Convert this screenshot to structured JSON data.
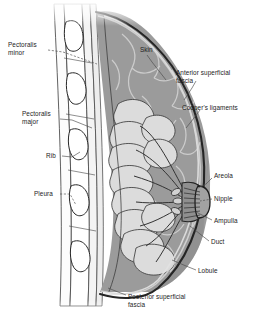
{
  "figure": {
    "type": "medical-illustration",
    "background_color": "#ffffff"
  },
  "colors": {
    "skin_line": "#2b2b2b",
    "fat_tissue": "#9b9b9b",
    "fat_tissue_dark": "#7e7e7e",
    "lobule_fill": "#d9d9d9",
    "ligament_stroke": "#c8c8c8",
    "muscle_fill": "#f2f2f2",
    "rib_fill": "#fbfbfb",
    "label_text": "#1c1c1c",
    "leader_line": "#555555"
  },
  "labels": {
    "left": [
      {
        "id": "pectoralis-minor",
        "text": "Pectoralis\nminor",
        "x": 8,
        "y": 41
      },
      {
        "id": "pectoralis-major",
        "text": "Pectoralis\nmajor",
        "x": 22,
        "y": 110
      },
      {
        "id": "rib",
        "text": "Rib",
        "x": 46,
        "y": 152
      },
      {
        "id": "pleura",
        "text": "Pleura",
        "x": 34,
        "y": 190
      }
    ],
    "right": [
      {
        "id": "skin",
        "text": "Skin",
        "x": 140,
        "y": 46
      },
      {
        "id": "anterior-superficial-fascia",
        "text": "Anterior superficial\nfascia",
        "x": 176,
        "y": 69
      },
      {
        "id": "coopers-ligaments",
        "text": "Cooper's ligaments",
        "x": 182,
        "y": 104
      },
      {
        "id": "areola",
        "text": "Areola",
        "x": 214,
        "y": 172
      },
      {
        "id": "nipple",
        "text": "Nipple",
        "x": 214,
        "y": 195
      },
      {
        "id": "ampulla",
        "text": "Ampulla",
        "x": 214,
        "y": 217
      },
      {
        "id": "duct",
        "text": "Duct",
        "x": 211,
        "y": 238
      },
      {
        "id": "lobule",
        "text": "Lobule",
        "x": 198,
        "y": 267
      }
    ],
    "bottom": [
      {
        "id": "posterior-superficial-fascia",
        "text": "Posterior superficial\nfascia",
        "x": 128,
        "y": 293
      }
    ]
  },
  "structures": [
    {
      "id": "skin",
      "name": "Skin",
      "description": "Outer boundary layer of the breast"
    },
    {
      "id": "anterior-superficial-fascia",
      "name": "Anterior superficial fascia",
      "description": "Thin fascial layer just beneath the skin"
    },
    {
      "id": "coopers-ligaments",
      "name": "Cooper's ligaments",
      "description": "Fibrous suspensory bands within fatty tissue"
    },
    {
      "id": "areola",
      "name": "Areola",
      "description": "Pigmented skin surrounding the nipple"
    },
    {
      "id": "nipple",
      "name": "Nipple",
      "description": "Projection at the centre of the areola"
    },
    {
      "id": "ampulla",
      "name": "Ampulla",
      "description": "Dilated portion of a lactiferous duct"
    },
    {
      "id": "duct",
      "name": "Duct",
      "description": "Lactiferous duct carrying milk to the nipple"
    },
    {
      "id": "lobule",
      "name": "Lobule",
      "description": "Cluster of milk-producing alveoli"
    },
    {
      "id": "posterior-superficial-fascia",
      "name": "Posterior superficial fascia",
      "description": "Fascial layer at the back of the breast"
    },
    {
      "id": "pectoralis-major",
      "name": "Pectoralis major",
      "description": "Large chest wall muscle"
    },
    {
      "id": "pectoralis-minor",
      "name": "Pectoralis minor",
      "description": "Smaller muscle beneath pectoralis major"
    },
    {
      "id": "rib",
      "name": "Rib",
      "description": "Bony chest wall segment"
    },
    {
      "id": "pleura",
      "name": "Pleura",
      "description": "Membrane lining the thoracic cavity"
    }
  ]
}
